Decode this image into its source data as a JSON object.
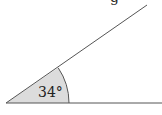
{
  "diagram": {
    "type": "angle",
    "angle_label": "34°",
    "angle_degrees": 34,
    "top_label_fragment": "g",
    "colors": {
      "line": "#555555",
      "fill": "#dcdcdc",
      "text": "#222222"
    }
  }
}
